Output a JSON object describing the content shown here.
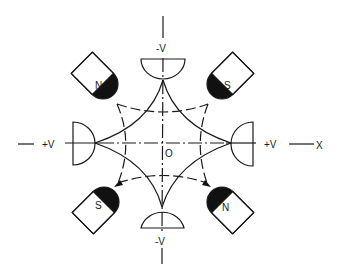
{
  "diagram": {
    "colors": {
      "line": "#1a1a1a",
      "fill_dark": "#111111",
      "background": "#ffffff"
    },
    "labels": {
      "origin": "O",
      "x_axis": "X",
      "electrode_top": "-V",
      "electrode_bottom": "-V",
      "electrode_left": "+V",
      "electrode_right": "+V",
      "magnet_top_left": "N",
      "magnet_top_right": "S",
      "magnet_bottom_left": "S",
      "magnet_bottom_right": "N"
    },
    "electrodes": [
      {
        "position": "top",
        "voltage": "-V"
      },
      {
        "position": "bottom",
        "voltage": "-V"
      },
      {
        "position": "left",
        "voltage": "+V"
      },
      {
        "position": "right",
        "voltage": "+V"
      }
    ],
    "magnets": [
      {
        "position": "top-left",
        "pole": "N"
      },
      {
        "position": "top-right",
        "pole": "S"
      },
      {
        "position": "bottom-left",
        "pole": "S"
      },
      {
        "position": "bottom-right",
        "pole": "N"
      }
    ]
  }
}
